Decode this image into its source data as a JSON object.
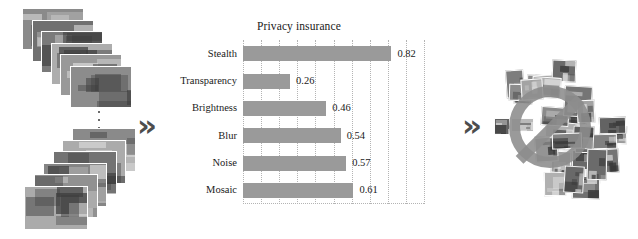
{
  "figure": {
    "flow_arrow_1": "»",
    "flow_arrow_2": "»",
    "ellipsis_symbol": "vertical-ellipsis"
  },
  "left_panel": {
    "name": "input-image-stacks",
    "top_stack_count": 6,
    "bottom_stack_count": 6
  },
  "right_panel": {
    "name": "protected-image-collage",
    "tile_count": 34,
    "overlay_icon": "prohibition-sign"
  },
  "chart_data": {
    "type": "bar",
    "orientation": "horizontal",
    "title": "Privacy insurance",
    "xlabel": "",
    "ylabel": "",
    "categories": [
      "Stealth",
      "Transparency",
      "Brightness",
      "Blur",
      "Noise",
      "Mosaic"
    ],
    "values": [
      0.82,
      0.26,
      0.46,
      0.54,
      0.57,
      0.61
    ],
    "value_labels": [
      "0.82",
      "0.26",
      "0.46",
      "0.54",
      "0.57",
      "0.61"
    ],
    "xlim": [
      0,
      1.0
    ],
    "grid": true,
    "grid_style": "dotted-vertical",
    "gridline_count": 10,
    "legend": "none",
    "bar_color": "#9a9a9a",
    "grid_color": "#b4b4b4",
    "text_color": "#1a1a1a"
  }
}
